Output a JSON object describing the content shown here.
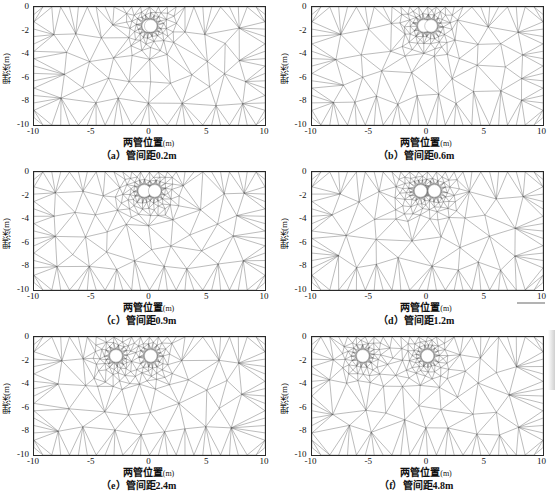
{
  "figure": {
    "kind": "finite-element-mesh-grid",
    "rows": 3,
    "cols": 2,
    "axis_titles": {
      "x": "两管位置",
      "x_unit": "(m)",
      "y": "埋深(m)"
    },
    "x_ticks": [
      "-10",
      "-5",
      "0",
      "5",
      "10"
    ],
    "x_tick_values": [
      -10,
      -5,
      0,
      5,
      10
    ],
    "y_ticks": [
      "0",
      "-2",
      "-4",
      "-6",
      "-8",
      "-10"
    ],
    "y_tick_values": [
      0,
      -2,
      -4,
      -6,
      -8,
      -10
    ],
    "xlim": [
      -10,
      10
    ],
    "ylim": [
      -10,
      0
    ],
    "mesh_color": "#555555",
    "pipe_color": "#ffffff",
    "frame_color": "#2a2a2a"
  },
  "chart_data": {
    "type": "scatter",
    "title": "",
    "xlabel": "两管位置(m)",
    "ylabel": "埋深(m)",
    "xlim": [
      -10,
      10
    ],
    "ylim": [
      -10,
      0
    ],
    "grid": false,
    "legend": "none",
    "panels": [
      {
        "tag": "（a）",
        "label": "管间距0.2m",
        "spacing_m": 0.2,
        "pipe_depth_m": -1.6,
        "pipe_radius_m": 0.35,
        "pipe_x": [
          -0.1,
          0.1
        ],
        "refine_halfwidth_m": 2.2,
        "refine_strength": 1.0
      },
      {
        "tag": "（b）",
        "label": "管间距0.6m",
        "spacing_m": 0.6,
        "pipe_depth_m": -1.6,
        "pipe_radius_m": 0.35,
        "pipe_x": [
          -0.3,
          0.3
        ],
        "refine_halfwidth_m": 2.4,
        "refine_strength": 1.0
      },
      {
        "tag": "（c）",
        "label": "管间距0.9m",
        "spacing_m": 0.9,
        "pipe_depth_m": -1.6,
        "pipe_radius_m": 0.35,
        "pipe_x": [
          -0.45,
          0.45
        ],
        "refine_halfwidth_m": 2.6,
        "refine_strength": 0.95
      },
      {
        "tag": "（d）",
        "label": "管间距1.2m",
        "spacing_m": 1.2,
        "pipe_depth_m": -1.6,
        "pipe_radius_m": 0.35,
        "pipe_x": [
          -0.6,
          0.6
        ],
        "refine_halfwidth_m": 2.8,
        "refine_strength": 0.95
      },
      {
        "tag": "（e）",
        "label": "管间距2.4m",
        "spacing_m": 2.4,
        "pipe_depth_m": -1.6,
        "pipe_radius_m": 0.35,
        "pipe_x": [
          -2.9,
          0.1
        ],
        "refine_halfwidth_m": 3.4,
        "refine_strength": 0.9
      },
      {
        "tag": "（f）",
        "label": "管间距4.8m",
        "spacing_m": 4.8,
        "pipe_depth_m": -1.6,
        "pipe_radius_m": 0.35,
        "pipe_x": [
          -5.6,
          0.0
        ],
        "refine_halfwidth_m": 4.6,
        "refine_strength": 0.85
      }
    ]
  }
}
